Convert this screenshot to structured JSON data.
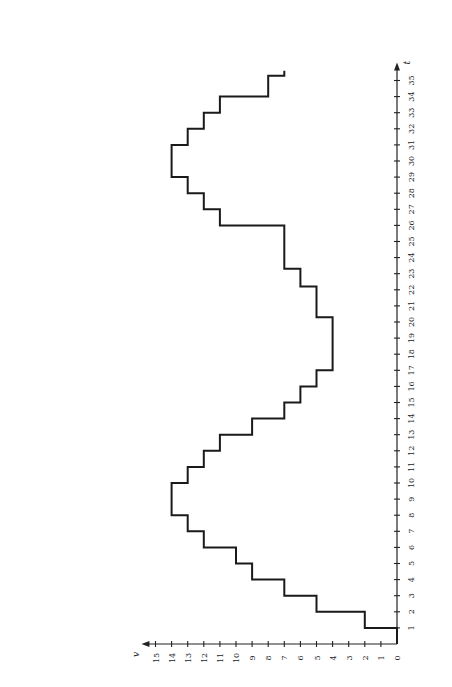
{
  "chart_data": {
    "type": "line",
    "subtype": "step",
    "orientation": "rotated-90-ccw",
    "title": "",
    "xlabel": "t",
    "ylabel": "v",
    "xlim": [
      0,
      36
    ],
    "ylim": [
      0,
      15.5
    ],
    "x_ticks": [
      1,
      2,
      3,
      4,
      5,
      6,
      7,
      8,
      9,
      10,
      11,
      12,
      13,
      14,
      15,
      16,
      17,
      18,
      19,
      20,
      21,
      22,
      23,
      24,
      25,
      26,
      27,
      28,
      29,
      30,
      31,
      32,
      33,
      34,
      35
    ],
    "y_ticks": [
      0,
      1,
      2,
      3,
      4,
      5,
      6,
      7,
      8,
      9,
      10,
      11,
      12,
      13,
      14,
      15
    ],
    "grid": false,
    "legend": null,
    "series": [
      {
        "name": "v(t)",
        "steps": [
          {
            "t_start": 0,
            "t_end": 1,
            "v": 0
          },
          {
            "t_start": 1,
            "t_end": 2,
            "v": 2
          },
          {
            "t_start": 2,
            "t_end": 3,
            "v": 5
          },
          {
            "t_start": 3,
            "t_end": 4,
            "v": 7
          },
          {
            "t_start": 4,
            "t_end": 5,
            "v": 9
          },
          {
            "t_start": 5,
            "t_end": 6,
            "v": 10
          },
          {
            "t_start": 6,
            "t_end": 7,
            "v": 12
          },
          {
            "t_start": 7,
            "t_end": 8,
            "v": 13
          },
          {
            "t_start": 8,
            "t_end": 10,
            "v": 14
          },
          {
            "t_start": 10,
            "t_end": 11,
            "v": 13
          },
          {
            "t_start": 11,
            "t_end": 12,
            "v": 12
          },
          {
            "t_start": 12,
            "t_end": 13,
            "v": 11
          },
          {
            "t_start": 13,
            "t_end": 14,
            "v": 9
          },
          {
            "t_start": 14,
            "t_end": 15,
            "v": 7
          },
          {
            "t_start": 15,
            "t_end": 16,
            "v": 6
          },
          {
            "t_start": 16,
            "t_end": 17,
            "v": 5
          },
          {
            "t_start": 17,
            "t_end": 20.3,
            "v": 4
          },
          {
            "t_start": 20.3,
            "t_end": 22.2,
            "v": 5
          },
          {
            "t_start": 22.2,
            "t_end": 23.3,
            "v": 6
          },
          {
            "t_start": 23.3,
            "t_end": 26,
            "v": 7
          },
          {
            "t_start": 26,
            "t_end": 27,
            "v": 11
          },
          {
            "t_start": 27,
            "t_end": 28,
            "v": 12
          },
          {
            "t_start": 28,
            "t_end": 29,
            "v": 13
          },
          {
            "t_start": 29,
            "t_end": 31,
            "v": 14
          },
          {
            "t_start": 31,
            "t_end": 32,
            "v": 13
          },
          {
            "t_start": 32,
            "t_end": 33,
            "v": 12
          },
          {
            "t_start": 33,
            "t_end": 34,
            "v": 11
          },
          {
            "t_start": 34,
            "t_end": 35.3,
            "v": 8
          },
          {
            "t_start": 35.3,
            "t_end": 35.6,
            "v": 7
          }
        ]
      }
    ]
  },
  "layout": {
    "origin_px": [
      397,
      644
    ],
    "unit_px": 16.1,
    "line_color": "#1a1a1a"
  }
}
